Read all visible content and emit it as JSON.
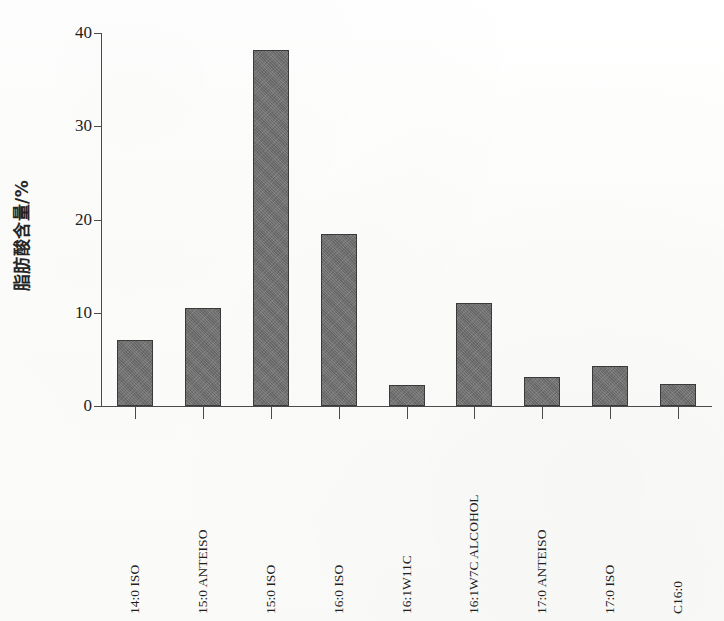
{
  "chart_data": {
    "type": "bar",
    "title": "",
    "subtitle": "",
    "xlabel": "",
    "ylabel": "脂肪酸含量/%",
    "ylim": [
      0,
      40
    ],
    "yticks": [
      0,
      10,
      20,
      30,
      40
    ],
    "ytick_labels": [
      "0",
      "10",
      "20",
      "30",
      "40"
    ],
    "grid": false,
    "legend": false,
    "legend_position": "none",
    "bar_color": "#6e6e6e",
    "bar_edge_color": "#3a3a3a",
    "axis_color": "#4a4a4a",
    "background_color": "#fdfdfc",
    "categories": [
      "14:0 ISO",
      "15:0 ANTEISO",
      "15:0 ISO",
      "16:0 ISO",
      "16:1W11C",
      "16:1W7C ALCOHOL",
      "17:0 ANTEISO",
      "17:0 ISO",
      "C16:0"
    ],
    "values": [
      7.1,
      10.5,
      38.2,
      18.5,
      2.3,
      11.0,
      3.1,
      4.3,
      2.4
    ],
    "annotations": []
  },
  "axis": {
    "y_title": "脂肪酸含量/%"
  }
}
